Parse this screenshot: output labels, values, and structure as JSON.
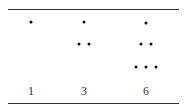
{
  "colors": {
    "rule": "#333333",
    "dot": "#111111",
    "label": "#333333"
  },
  "columns": [
    {
      "label": "1",
      "center_x": 31,
      "rows": [
        {
          "y": 22,
          "xs": [
            31
          ]
        }
      ]
    },
    {
      "label": "3",
      "center_x": 84,
      "rows": [
        {
          "y": 22,
          "xs": [
            84
          ]
        },
        {
          "y": 44,
          "xs": [
            79,
            89
          ]
        }
      ]
    },
    {
      "label": "6",
      "center_x": 146,
      "rows": [
        {
          "y": 23,
          "xs": [
            146
          ]
        },
        {
          "y": 44,
          "xs": [
            141,
            151
          ]
        },
        {
          "y": 67,
          "xs": [
            136,
            146,
            156
          ]
        }
      ]
    }
  ]
}
